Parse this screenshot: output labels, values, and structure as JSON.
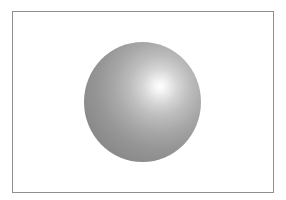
{
  "figure": {
    "colors": {
      "background": "#ffffff",
      "border": "#8f8f8f",
      "sphere_highlight": "#ffffff",
      "sphere_mid": "#a8a8a8",
      "sphere_edge": "#808080"
    }
  }
}
